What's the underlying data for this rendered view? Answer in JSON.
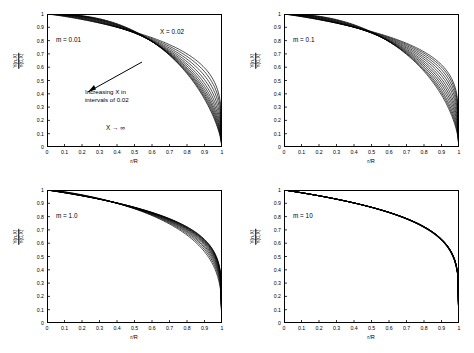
{
  "chart_data": {
    "type": "line",
    "title": "",
    "panels": [
      {
        "id": "panel-m-0p01",
        "label": "m = 0.01",
        "xlabel": "r/R",
        "ylabel_num": "Y(n,X)",
        "ylabel_den": "Y(0,X)",
        "xlim": [
          0,
          1
        ],
        "ylim": [
          0,
          1
        ],
        "xticks": [
          "0",
          "0.1",
          "0.2",
          "0.3",
          "0.4",
          "0.5",
          "0.6",
          "0.7",
          "0.8",
          "0.9",
          "1"
        ],
        "yticks": [
          "0",
          "0.1",
          "0.2",
          "0.3",
          "0.4",
          "0.5",
          "0.6",
          "0.7",
          "0.8",
          "0.9",
          "1"
        ],
        "annotations": [
          {
            "name": "x-002-label",
            "text": "X = 0.02"
          },
          {
            "name": "increasing-x-note",
            "line1": "Increasing X in",
            "line2": "intervals of 0.02"
          },
          {
            "name": "x-infinity-label",
            "text": "X → ∞"
          }
        ],
        "curve_shapes": [
          0.06,
          0.12,
          0.2,
          0.3,
          0.42,
          0.56,
          0.72,
          0.9,
          1.1,
          1.35,
          1.65,
          2.0
        ]
      },
      {
        "id": "panel-m-0p1",
        "label": "m = 0.1",
        "xlabel": "r/R",
        "ylabel_num": "Y(n,X)",
        "ylabel_den": "Y(0,X)",
        "xlim": [
          0,
          1
        ],
        "ylim": [
          0,
          1
        ],
        "xticks": [
          "0",
          "0.1",
          "0.2",
          "0.3",
          "0.4",
          "0.5",
          "0.6",
          "0.7",
          "0.8",
          "0.9",
          "1"
        ],
        "yticks": [
          "0",
          "0.1",
          "0.2",
          "0.3",
          "0.4",
          "0.5",
          "0.6",
          "0.7",
          "0.8",
          "0.9",
          "1"
        ],
        "annotations": [],
        "curve_shapes": [
          0.02,
          0.05,
          0.09,
          0.14,
          0.2,
          0.28,
          0.37,
          0.48,
          0.62,
          0.8,
          1.0,
          1.25
        ]
      },
      {
        "id": "panel-m-1p0",
        "label": "m = 1.0",
        "xlabel": "r/R",
        "ylabel_num": "Y(n,X)",
        "ylabel_den": "Y(0,X)",
        "xlim": [
          0,
          1
        ],
        "ylim": [
          0,
          1
        ],
        "xticks": [
          "0",
          "0.1",
          "0.2",
          "0.3",
          "0.4",
          "0.5",
          "0.6",
          "0.7",
          "0.8",
          "0.9",
          "1"
        ],
        "yticks": [
          "0",
          "0.1",
          "0.2",
          "0.3",
          "0.4",
          "0.5",
          "0.6",
          "0.7",
          "0.8",
          "0.9",
          "1"
        ],
        "annotations": [],
        "curve_shapes": [
          0.004,
          0.008,
          0.014,
          0.021,
          0.03,
          0.041,
          0.055,
          0.072,
          0.094,
          0.12,
          0.155,
          0.2
        ]
      },
      {
        "id": "panel-m-10",
        "label": "m = 10",
        "xlabel": "r/R",
        "ylabel_num": "Y(n,X)",
        "ylabel_den": "Y(0,X)",
        "xlim": [
          0,
          1
        ],
        "ylim": [
          0,
          1
        ],
        "xticks": [
          "0",
          "0.1",
          "0.2",
          "0.3",
          "0.4",
          "0.5",
          "0.6",
          "0.7",
          "0.8",
          "0.9",
          "1"
        ],
        "yticks": [
          "0",
          "0.1",
          "0.2",
          "0.3",
          "0.4",
          "0.5",
          "0.6",
          "0.7",
          "0.8",
          "0.9",
          "1"
        ],
        "annotations": [],
        "curve_shapes": [
          0.0004,
          0.0009,
          0.0015,
          0.0022,
          0.003,
          0.004,
          0.0052,
          0.0066,
          0.0082,
          0.01,
          0.012,
          0.015
        ]
      }
    ],
    "line_color": "#000000",
    "grid": false,
    "legend": "none"
  }
}
